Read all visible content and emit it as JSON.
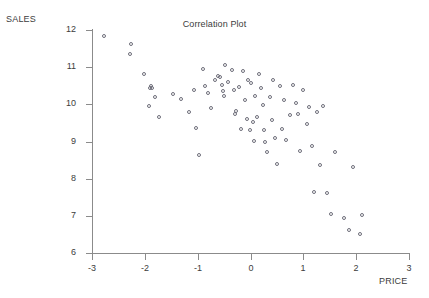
{
  "chart_data": {
    "type": "scatter",
    "title": "Correlation Plot",
    "xlabel": "PRICE",
    "ylabel": "SALES",
    "xlim": [
      -3,
      3
    ],
    "ylim": [
      6,
      12
    ],
    "grid": false,
    "legend": null,
    "xticks": [
      "-3",
      "-2",
      "-1",
      "0",
      "1",
      "2",
      "3"
    ],
    "xtick_values": [
      -3,
      -2,
      -1,
      0,
      1,
      2,
      3
    ],
    "yticks": [
      "6",
      "7",
      "8",
      "9",
      "10",
      "11",
      "12"
    ],
    "ytick_values": [
      6,
      7,
      8,
      9,
      10,
      11,
      12
    ],
    "marker": "open-circle",
    "marker_color": "#6e6e7a",
    "axis_color": "#8b8b8b",
    "series": [
      {
        "name": "observations",
        "points": [
          [
            -2.76,
            11.82
          ],
          [
            -2.25,
            11.6
          ],
          [
            -2.27,
            11.33
          ],
          [
            -1.99,
            10.8
          ],
          [
            -1.87,
            10.46
          ],
          [
            -1.88,
            10.42
          ],
          [
            -1.85,
            10.4
          ],
          [
            -1.78,
            10.17
          ],
          [
            -1.9,
            9.92
          ],
          [
            -1.72,
            9.62
          ],
          [
            -1.45,
            10.24
          ],
          [
            -1.29,
            10.12
          ],
          [
            -1.15,
            9.78
          ],
          [
            -1.05,
            10.37
          ],
          [
            -1.02,
            9.34
          ],
          [
            -0.95,
            8.6
          ],
          [
            -0.88,
            10.93
          ],
          [
            -0.84,
            10.46
          ],
          [
            -0.78,
            10.27
          ],
          [
            -0.72,
            9.88
          ],
          [
            -0.66,
            10.62
          ],
          [
            -0.6,
            10.74
          ],
          [
            -0.55,
            10.7
          ],
          [
            -0.52,
            10.49
          ],
          [
            -0.5,
            10.34
          ],
          [
            -0.48,
            10.2
          ],
          [
            -0.46,
            11.02
          ],
          [
            -0.4,
            10.58
          ],
          [
            -0.33,
            10.9
          ],
          [
            -0.3,
            10.35
          ],
          [
            -0.28,
            9.72
          ],
          [
            -0.25,
            9.8
          ],
          [
            -0.2,
            10.43
          ],
          [
            -0.17,
            9.32
          ],
          [
            -0.12,
            10.88
          ],
          [
            -0.09,
            10.1
          ],
          [
            -0.05,
            9.58
          ],
          [
            -0.02,
            10.63
          ],
          [
            0.0,
            9.28
          ],
          [
            0.03,
            10.56
          ],
          [
            0.06,
            9.5
          ],
          [
            0.08,
            9.0
          ],
          [
            0.1,
            10.2
          ],
          [
            0.14,
            9.62
          ],
          [
            0.18,
            10.8
          ],
          [
            0.22,
            10.4
          ],
          [
            0.25,
            9.95
          ],
          [
            0.28,
            9.28
          ],
          [
            0.3,
            8.95
          ],
          [
            0.34,
            8.68
          ],
          [
            0.38,
            10.18
          ],
          [
            0.42,
            9.55
          ],
          [
            0.45,
            10.62
          ],
          [
            0.48,
            9.08
          ],
          [
            0.52,
            8.38
          ],
          [
            0.58,
            10.46
          ],
          [
            0.62,
            9.32
          ],
          [
            0.66,
            10.1
          ],
          [
            0.7,
            9.02
          ],
          [
            0.76,
            9.68
          ],
          [
            0.82,
            10.48
          ],
          [
            0.88,
            10.02
          ],
          [
            0.92,
            9.7
          ],
          [
            0.96,
            8.72
          ],
          [
            1.02,
            10.35
          ],
          [
            1.08,
            9.45
          ],
          [
            1.12,
            9.9
          ],
          [
            1.18,
            8.85
          ],
          [
            1.22,
            7.62
          ],
          [
            1.28,
            9.78
          ],
          [
            1.34,
            8.35
          ],
          [
            1.4,
            9.92
          ],
          [
            1.46,
            7.6
          ],
          [
            1.55,
            7.02
          ],
          [
            1.62,
            8.7
          ],
          [
            1.78,
            6.92
          ],
          [
            1.88,
            6.58
          ],
          [
            2.1,
            6.48
          ],
          [
            2.12,
            7.0
          ],
          [
            1.95,
            8.3
          ]
        ]
      }
    ]
  }
}
